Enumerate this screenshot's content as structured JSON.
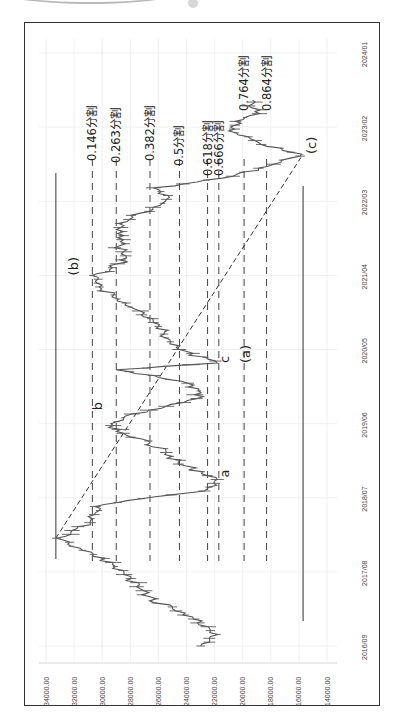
{
  "chart_data": {
    "type": "line",
    "title": "",
    "orientation": "rotated-90-ccw",
    "xlabel": "",
    "ylabel": "",
    "x_tick_labels": [
      "2016/09",
      "2017/08",
      "2018/07",
      "2019/06",
      "2020/05",
      "2021/04",
      "2022/03",
      "2023/02",
      "2024/01"
    ],
    "y_tick_labels": [
      "14000.00",
      "16000.00",
      "18000.00",
      "20000.00",
      "22000.00",
      "24000.00",
      "26000.00",
      "28000.00",
      "30000.00",
      "32000.00",
      "34000.00"
    ],
    "ylim": [
      14000,
      34000
    ],
    "grid": true,
    "series": [
      {
        "name": "price",
        "x": [
          "2016/09",
          "2016/11",
          "2017/01",
          "2017/04",
          "2017/07",
          "2017/10",
          "2018/01",
          "2018/03",
          "2018/06",
          "2018/08",
          "2018/10",
          "2018/12",
          "2019/02",
          "2019/04",
          "2019/06",
          "2019/08",
          "2019/10",
          "2019/12",
          "2020/02",
          "2020/03",
          "2020/05",
          "2020/07",
          "2020/09",
          "2020/11",
          "2021/02",
          "2021/04",
          "2021/06",
          "2021/09",
          "2021/12",
          "2022/03",
          "2022/05",
          "2022/07",
          "2022/10",
          "2022/12",
          "2023/02",
          "2023/04",
          "2023/06"
        ],
        "values": [
          23000,
          22000,
          23500,
          26500,
          28000,
          30000,
          33300,
          31000,
          30200,
          22500,
          22000,
          24500,
          25500,
          27800,
          29800,
          26700,
          23000,
          24000,
          28800,
          21700,
          24800,
          25500,
          26000,
          27500,
          30000,
          30400,
          28500,
          28800,
          28500,
          25500,
          26000,
          20200,
          15700,
          19500,
          21000,
          19000,
          19300
        ]
      }
    ],
    "annotations": {
      "fib_levels": [
        {
          "label": "0.146分割",
          "value": 30700
        },
        {
          "label": "0.263分割",
          "value": 29000
        },
        {
          "label": "0.382分割",
          "value": 26600
        },
        {
          "label": "0.5分割",
          "value": 24500
        },
        {
          "label": "0.618分割",
          "value": 22500
        },
        {
          "label": "0.666分割",
          "value": 21700
        },
        {
          "label": "0.764分割",
          "value": 19900
        },
        {
          "label": "0.864分割",
          "value": 18300
        }
      ],
      "wave_labels": [
        {
          "label": "a",
          "x": "2018/10",
          "value": 21000
        },
        {
          "label": "b",
          "x": "2019/08",
          "value": 30000
        },
        {
          "label": "c",
          "x": "2020/03",
          "value": 21000
        },
        {
          "label": "(a)",
          "x": "2020/03",
          "value": 19500
        },
        {
          "label": "(b)",
          "x": "2021/04",
          "value": 31700
        },
        {
          "label": "(c)",
          "x": "2022/10",
          "value": 14800
        }
      ],
      "trendline": {
        "from": {
          "x": "2018/01",
          "value": 33300
        },
        "to": {
          "x": "2022/10",
          "value": 15700
        },
        "style": "dashed"
      },
      "high_line_value": 33300,
      "low_line_value": 15700
    }
  }
}
